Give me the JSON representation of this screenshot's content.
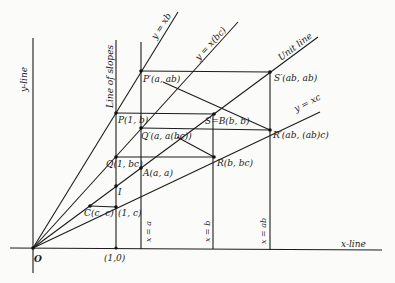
{
  "diagram": {
    "axes": {
      "x_axis_label": "x-line",
      "y_axis_label": "y-line",
      "origin_label": "O",
      "unit_point_label": "(1,0)"
    },
    "vertical_lines": {
      "slopes_label": "Line of slopes",
      "x_eq_a": "x = a",
      "x_eq_b": "x = b",
      "x_eq_ab": "x = ab"
    },
    "rays": {
      "y_eq_xb": "y = xb",
      "y_eq_xbc": "y = x(bc)",
      "unit_line": "Unit line",
      "y_eq_xc": "y = xc"
    },
    "points": {
      "P_prime": "P′(a, ab)",
      "S_prime": "S′(ab, ab)",
      "P": "P(1, b)",
      "Q_prime": "Q′(a, a(bc))",
      "S_B": "S=B(b, b)",
      "R_prime": "R′(ab, (ab)c)",
      "Q": "Q(1, bc)",
      "A": "A(a, a)",
      "R": "R(b, bc)",
      "I": "I",
      "C": "C(c, c)",
      "one_c": "(1, c)"
    }
  }
}
